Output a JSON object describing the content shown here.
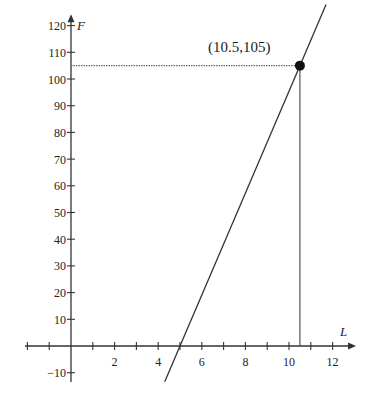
{
  "chart_data": {
    "type": "line",
    "title": "",
    "xlabel": "L",
    "ylabel": "F",
    "xlim": [
      -1.5,
      12.8
    ],
    "ylim": [
      -13,
      122
    ],
    "x_ticks": [
      -1,
      1,
      2,
      3,
      4,
      5,
      6,
      7,
      8,
      9,
      10,
      11,
      12
    ],
    "x_tick_labels": [
      {
        "value": 2,
        "label": "2"
      },
      {
        "value": 4,
        "label": "4"
      },
      {
        "value": 6,
        "label": "6"
      },
      {
        "value": 8,
        "label": "8"
      },
      {
        "value": 10,
        "label": "10"
      },
      {
        "value": 12,
        "label": "12"
      }
    ],
    "y_ticks": [
      -10,
      10,
      20,
      30,
      40,
      50,
      60,
      70,
      80,
      90,
      100,
      110,
      120
    ],
    "y_tick_labels": [
      {
        "value": -10,
        "label": "-10"
      },
      {
        "value": 10,
        "label": "10"
      },
      {
        "value": 20,
        "label": "20"
      },
      {
        "value": 30,
        "label": "30"
      },
      {
        "value": 40,
        "label": "40"
      },
      {
        "value": 50,
        "label": "50"
      },
      {
        "value": 60,
        "label": "60"
      },
      {
        "value": 70,
        "label": "70"
      },
      {
        "value": 80,
        "label": "80"
      },
      {
        "value": 90,
        "label": "90"
      },
      {
        "value": 100,
        "label": "100"
      },
      {
        "value": 110,
        "label": "110"
      },
      {
        "value": 120,
        "label": "120"
      }
    ],
    "grid": false,
    "series": [
      {
        "name": "F(L)",
        "x": [
          4.3,
          5,
          10.5,
          11.7
        ],
        "y": [
          -13.4,
          0,
          105,
          127.9
        ],
        "style": "solid",
        "color": "#333333"
      }
    ],
    "points": [
      {
        "x": 10.5,
        "y": 105,
        "label": "(10.5,105)",
        "color": "#111111"
      }
    ],
    "guides": [
      {
        "type": "horizontal",
        "y": 105,
        "from_x": 0,
        "to_x": 10.5,
        "style": "dotted"
      },
      {
        "type": "vertical",
        "x": 10.5,
        "from_y": 0,
        "to_y": 105,
        "style": "solid"
      }
    ]
  },
  "labels": {
    "point_annotation": "(10.5,105)",
    "x_axis_label": "L",
    "y_axis_label": "F"
  }
}
